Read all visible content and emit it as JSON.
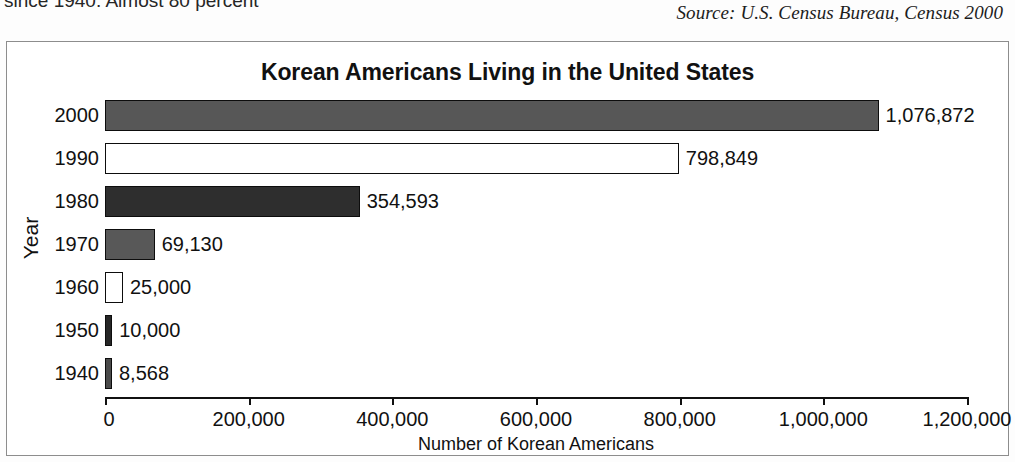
{
  "page": {
    "body_text_fragment": "since 1940. Almost 80 percent",
    "source_credit": "Source: U.S. Census Bureau, Census 2000"
  },
  "chart_data": {
    "type": "bar",
    "orientation": "horizontal",
    "title": "Korean Americans Living in the United States",
    "xlabel": "Number of Korean Americans",
    "ylabel": "Year",
    "categories": [
      "2000",
      "1990",
      "1980",
      "1970",
      "1960",
      "1950",
      "1940"
    ],
    "values": [
      1076872,
      798849,
      354593,
      69130,
      25000,
      10000,
      8568
    ],
    "value_labels": [
      "1,076,872",
      "798,849",
      "354,593",
      "69,130",
      "25,000",
      "10,000",
      "8,568"
    ],
    "bar_colors": [
      "#575757",
      "#ffffff",
      "#2e2e2e",
      "#585858",
      "#ffffff",
      "#262626",
      "#4a4a4a"
    ],
    "bar_border_color": "#0d0d0d",
    "xlim": [
      0,
      1200000
    ],
    "x_ticks": [
      0,
      200000,
      400000,
      600000,
      800000,
      1000000,
      1200000
    ],
    "x_tick_labels": [
      "0",
      "200,000",
      "400,000",
      "600,000",
      "800,000",
      "1,000,000",
      "1,200,000"
    ],
    "grid": false,
    "legend": null
  }
}
